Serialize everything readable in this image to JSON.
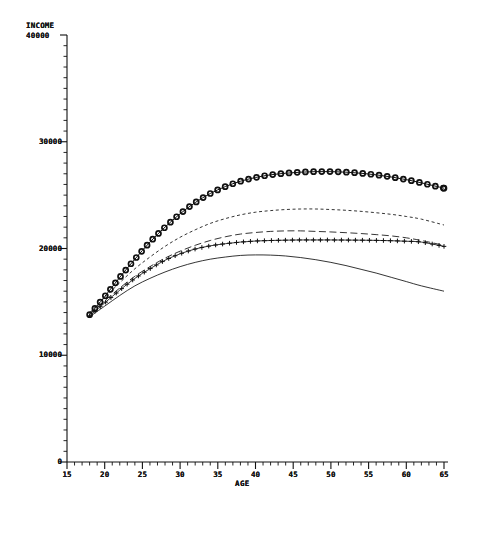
{
  "chart_data": {
    "type": "line",
    "title": "",
    "xlabel": "AGE",
    "ylabel": "INCOME",
    "xlim": [
      15,
      65
    ],
    "ylim": [
      0,
      40000
    ],
    "grid": false,
    "legend_position": "bottom",
    "legend_title": "LEGEND: EDUC",
    "xticks": [
      "15",
      "20",
      "25",
      "30",
      "35",
      "40",
      "45",
      "50",
      "55",
      "60",
      "65"
    ],
    "yticks": [
      "0",
      "10000",
      "20000",
      "30000",
      "40000"
    ],
    "x": [
      18,
      20,
      22,
      24,
      26,
      28,
      30,
      32,
      34,
      36,
      38,
      40,
      42,
      44,
      46,
      48,
      50,
      52,
      54,
      56,
      58,
      60,
      62,
      65
    ],
    "series": [
      {
        "name": "LEVEL 1",
        "style": "solid",
        "marker": "none",
        "values": [
          13600,
          14600,
          15600,
          16500,
          17200,
          17800,
          18300,
          18700,
          19000,
          19200,
          19350,
          19400,
          19380,
          19300,
          19150,
          18950,
          18700,
          18400,
          18050,
          17700,
          17300,
          16900,
          16500,
          16000
        ]
      },
      {
        "name": "LEVEL 2",
        "style": "long-dash",
        "marker": "none",
        "values": [
          13900,
          15100,
          16300,
          17400,
          18300,
          19100,
          19750,
          20300,
          20750,
          21100,
          21350,
          21500,
          21600,
          21650,
          21650,
          21600,
          21550,
          21480,
          21400,
          21300,
          21180,
          21000,
          20750,
          20300
        ]
      },
      {
        "name": "LEVEL 3",
        "style": "solid",
        "marker": "plus",
        "values": [
          13700,
          14900,
          16100,
          17200,
          18100,
          18900,
          19500,
          19950,
          20250,
          20450,
          20600,
          20700,
          20750,
          20780,
          20800,
          20800,
          20800,
          20790,
          20780,
          20760,
          20730,
          20680,
          20600,
          20200
        ]
      },
      {
        "name": "LEVEL 4",
        "style": "short-dash",
        "marker": "none",
        "values": [
          14000,
          15400,
          16800,
          18100,
          19200,
          20200,
          21050,
          21750,
          22350,
          22800,
          23150,
          23400,
          23550,
          23650,
          23700,
          23700,
          23650,
          23580,
          23480,
          23350,
          23200,
          23000,
          22750,
          22200
        ]
      },
      {
        "name": "LEVEL 5",
        "style": "solid",
        "marker": "circle",
        "values": [
          13800,
          15500,
          17300,
          19000,
          20600,
          22000,
          23250,
          24300,
          25150,
          25800,
          26300,
          26650,
          26900,
          27050,
          27150,
          27200,
          27200,
          27150,
          27050,
          26900,
          26700,
          26450,
          26150,
          25650
        ]
      }
    ]
  },
  "legend": {
    "title": "LEGEND: EDUC",
    "entries": [
      {
        "label": "LEVEL 1",
        "style": "solid",
        "marker": "none"
      },
      {
        "label": "LEVEL 2",
        "style": "long-dash",
        "marker": "none"
      },
      {
        "label": "LEVEL 3",
        "style": "solid",
        "marker": "plus"
      },
      {
        "label": "LEVEL 4",
        "style": "short-dash",
        "marker": "none"
      },
      {
        "label": "LEVEL 5",
        "style": "solid",
        "marker": "circle"
      }
    ]
  },
  "axes": {
    "y_title": "INCOME",
    "y_title_second": "40000",
    "x_title": "AGE"
  },
  "colors": {
    "ink": "#101010",
    "background": "#ffffff"
  }
}
